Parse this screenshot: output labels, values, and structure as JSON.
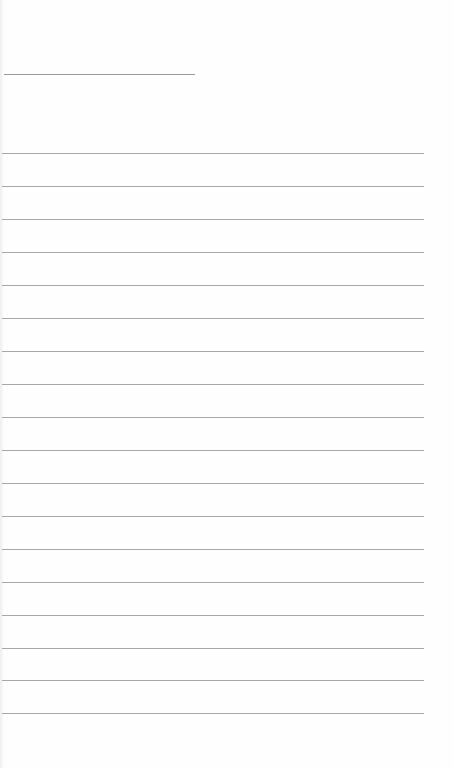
{
  "page": {
    "type": "blank lined paper",
    "background_color": "#fefefe",
    "rule_color": "#a8a8a8",
    "header_line": {
      "top": 74,
      "width": 191
    },
    "rules_top": [
      153,
      186,
      219,
      252,
      285,
      318,
      351,
      384,
      417,
      450,
      483,
      516,
      549,
      582,
      615,
      648,
      680,
      713
    ]
  }
}
